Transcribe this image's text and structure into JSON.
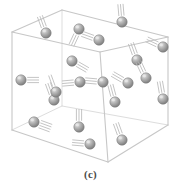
{
  "figure": {
    "caption": "(c)",
    "alt_description": "Wireframe cube containing many small gray spheres, each trailing short parallel motion lines"
  },
  "colors": {
    "background": "#ffffff",
    "cube_edge": "#c9c9c9",
    "cube_edge_back": "#dcdcdc",
    "sphere_fill": "#9a9a9a",
    "sphere_edge": "#7d7d7d",
    "sphere_highlight": "#e6e6e6",
    "motion_line": "#b9b9b9",
    "caption_text": "#4a4a4a"
  },
  "geometry": {
    "viewbox": "0 0 181 170",
    "cube_vertices": {
      "front_top_left": [
        12,
        32
      ],
      "front_top_right": [
        100,
        52
      ],
      "back_top_left": [
        62,
        10
      ],
      "back_top_right": [
        168,
        37
      ],
      "front_bottom_left": [
        12,
        130
      ],
      "front_bottom_right": [
        108,
        162
      ],
      "back_bottom_left": [
        62,
        106
      ],
      "back_bottom_right": [
        168,
        125
      ]
    },
    "sphere_radius": 5.2,
    "motion_line_count_typical": 3
  },
  "chart_data": {
    "type": "scatter",
    "xlabel": "",
    "ylabel": "",
    "particle_count": 20,
    "particles": [
      {
        "id": 1,
        "x": 46,
        "y": 33,
        "motion_angle_deg": 250,
        "lines": 3
      },
      {
        "id": 2,
        "x": 79,
        "y": 29,
        "motion_angle_deg": 115,
        "lines": 3
      },
      {
        "id": 3,
        "x": 122,
        "y": 22,
        "motion_angle_deg": 265,
        "lines": 3
      },
      {
        "id": 4,
        "x": 99,
        "y": 40,
        "motion_angle_deg": 200,
        "lines": 3
      },
      {
        "id": 5,
        "x": 163,
        "y": 47,
        "motion_angle_deg": 205,
        "lines": 3
      },
      {
        "id": 6,
        "x": 72,
        "y": 61,
        "motion_angle_deg": 30,
        "lines": 3
      },
      {
        "id": 7,
        "x": 21,
        "y": 80,
        "motion_angle_deg": 0,
        "lines": 3
      },
      {
        "id": 8,
        "x": 103,
        "y": 82,
        "motion_angle_deg": 185,
        "lines": 3
      },
      {
        "id": 9,
        "x": 128,
        "y": 83,
        "motion_angle_deg": 210,
        "lines": 3
      },
      {
        "id": 10,
        "x": 137,
        "y": 60,
        "motion_angle_deg": 250,
        "lines": 3
      },
      {
        "id": 11,
        "x": 54,
        "y": 100,
        "motion_angle_deg": 250,
        "lines": 3
      },
      {
        "id": 12,
        "x": 115,
        "y": 102,
        "motion_angle_deg": 255,
        "lines": 3
      },
      {
        "id": 13,
        "x": 163,
        "y": 99,
        "motion_angle_deg": 260,
        "lines": 3
      },
      {
        "id": 14,
        "x": 34,
        "y": 122,
        "motion_angle_deg": 20,
        "lines": 4
      },
      {
        "id": 15,
        "x": 79,
        "y": 127,
        "motion_angle_deg": 270,
        "lines": 3
      },
      {
        "id": 16,
        "x": 90,
        "y": 144,
        "motion_angle_deg": 185,
        "lines": 3
      },
      {
        "id": 17,
        "x": 122,
        "y": 140,
        "motion_angle_deg": 250,
        "lines": 3
      },
      {
        "id": 18,
        "x": 80,
        "y": 82,
        "motion_angle_deg": 175,
        "lines": 3
      },
      {
        "id": 19,
        "x": 56,
        "y": 92,
        "motion_angle_deg": 250,
        "lines": 2
      },
      {
        "id": 20,
        "x": 146,
        "y": 78,
        "motion_angle_deg": 245,
        "lines": 3
      }
    ]
  }
}
